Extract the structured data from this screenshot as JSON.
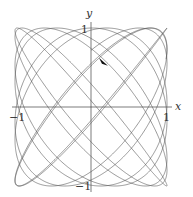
{
  "chart_data": {
    "type": "line",
    "title": "",
    "xlabel": "x",
    "ylabel": "y",
    "xlim": [
      -1,
      1
    ],
    "ylim": [
      -1,
      1
    ],
    "x_ticks": [
      {
        "value": -1,
        "label": "−1"
      },
      {
        "value": 1,
        "label": "1"
      }
    ],
    "y_ticks": [
      {
        "value": 1,
        "label": "1"
      },
      {
        "value": -1,
        "label": "−1"
      }
    ],
    "grid": false,
    "legend": null,
    "curve": {
      "kind": "parametric-lissajous",
      "x_expr": "sin(a*t)",
      "y_expr": "sin(b*t + phase)",
      "a": 1,
      "b": 1.12,
      "phase": 0.8,
      "t_range": [
        0,
        52
      ],
      "color": "#555555"
    },
    "direction_arrow": {
      "x": 0.17,
      "y": 0.56,
      "direction": "down-right",
      "color": "#111111"
    }
  }
}
